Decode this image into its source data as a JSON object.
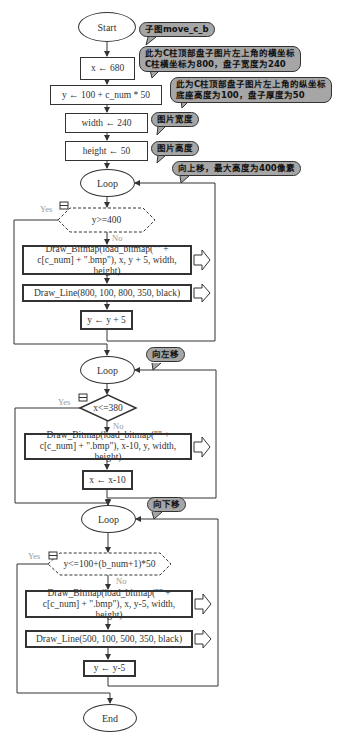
{
  "flowchart": {
    "start": "Start",
    "end": "End",
    "init": [
      {
        "text": "x ← 680"
      },
      {
        "text": "y ← 100 + c_num * 50"
      },
      {
        "text": "width ← 240"
      },
      {
        "text": "height ← 50"
      }
    ],
    "loops": [
      {
        "label": "Loop",
        "condition": "y>=400",
        "yes": "Yes",
        "no": "No",
        "steps": [
          "Draw_Bitmap(load_bitmap(\"\" + c[c_num] + \".bmp\"), x, y + 5, width, height)",
          "Draw_Line(800, 100, 800, 350, black)",
          "y ← y + 5"
        ],
        "comment": "向上移，最大高度为400像素"
      },
      {
        "label": "Loop",
        "condition": "x<=380",
        "yes": "Yes",
        "no": "No",
        "steps": [
          "Draw_Bitmap(load_bitmap(\"\" + c[c_num] + \".bmp\"), x-10, y, width, height)",
          "x ← x-10"
        ],
        "comment": "向左移"
      },
      {
        "label": "Loop",
        "condition": "y<=100+(b_num+1)*50",
        "yes": "Yes",
        "no": "No",
        "steps": [
          "Draw_Bitmap(load_bitmap(\"\" + c[c_num] + \".bmp\"), x, y-5, width, height)",
          "Draw_Line(500, 100, 500, 350, black)",
          "y ← y-5"
        ],
        "comment": "向下移"
      }
    ],
    "comments": {
      "subgraph": "子图move_c_b",
      "x_line1": "此为C柱顶部盘子图片左上角的横坐标",
      "x_line2": "C柱横坐标为800，盘子宽度为240",
      "y_line1": "此为C柱顶部盘子图片左上角的纵坐标",
      "y_line2": "底座高度为100，盘子厚度为50",
      "width": "图片宽度",
      "height": "图片高度"
    }
  }
}
